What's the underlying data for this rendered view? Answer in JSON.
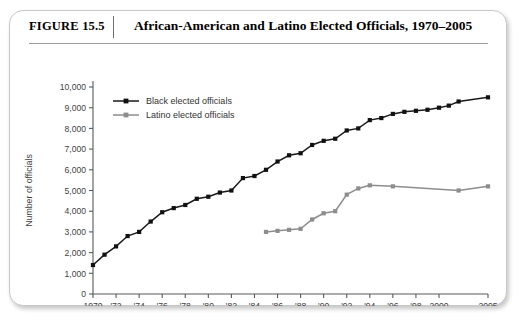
{
  "figure": {
    "number_label": "FIGURE 15.5",
    "title": "African-American and Latino Elected Officials, 1970–2005"
  },
  "chart_data": {
    "type": "line",
    "title": "African-American and Latino Elected Officials, 1970–2005",
    "xlabel": "",
    "ylabel": "Number of officials",
    "xlim": [
      1970,
      2005
    ],
    "ylim": [
      0,
      10000
    ],
    "grid": false,
    "legend_position": "top-left inside plot",
    "y_ticks": [
      0,
      1000,
      2000,
      3000,
      4000,
      5000,
      6000,
      7000,
      8000,
      9000,
      10000
    ],
    "y_ticklabels": [
      "0",
      "1,000",
      "2,000",
      "3,000",
      "4,000",
      "5,000",
      "6,000",
      "7,000",
      "8,000",
      "9,000",
      "10,000"
    ],
    "x_ticks": [
      1970,
      1972,
      1974,
      1976,
      1978,
      1980,
      1982,
      1984,
      1986,
      1988,
      1990,
      1992,
      1994,
      1996,
      1998,
      2000,
      2005
    ],
    "x_ticklabels": [
      "1970",
      "'72",
      "'74",
      "'76",
      "'78",
      "'80",
      "'82",
      "'84",
      "'86",
      "'88",
      "'90",
      "'92",
      "'94",
      "'96",
      "'98",
      "2000",
      "2005"
    ],
    "series": [
      {
        "name": "Black elected officials",
        "color": "#111111",
        "marker": "square",
        "x": [
          1970,
          1971,
          1972,
          1973,
          1974,
          1975,
          1976,
          1977,
          1978,
          1979,
          1980,
          1981,
          1982,
          1983,
          1984,
          1985,
          1986,
          1987,
          1988,
          1989,
          1990,
          1991,
          1992,
          1993,
          1994,
          1995,
          1996,
          1997,
          1998,
          1999,
          2000,
          2001,
          2002,
          2005
        ],
        "values": [
          1400,
          1900,
          2300,
          2800,
          3000,
          3500,
          3950,
          4150,
          4300,
          4600,
          4700,
          4900,
          5000,
          5600,
          5700,
          6000,
          6400,
          6700,
          6800,
          7200,
          7400,
          7500,
          7900,
          8000,
          8400,
          8500,
          8700,
          8800,
          8850,
          8900,
          9000,
          9100,
          9300,
          9500
        ]
      },
      {
        "name": "Latino elected officials",
        "color": "#8d8d8d",
        "marker": "square",
        "x": [
          1985,
          1986,
          1987,
          1988,
          1989,
          1990,
          1991,
          1992,
          1993,
          1994,
          1996,
          2002,
          2005
        ],
        "values": [
          3000,
          3050,
          3100,
          3150,
          3600,
          3900,
          4000,
          4800,
          5100,
          5250,
          5200,
          5000,
          5200
        ]
      }
    ]
  },
  "legend": {
    "items": [
      {
        "label": "Black elected officials",
        "color": "#111111"
      },
      {
        "label": "Latino elected officials",
        "color": "#8d8d8d"
      }
    ]
  }
}
